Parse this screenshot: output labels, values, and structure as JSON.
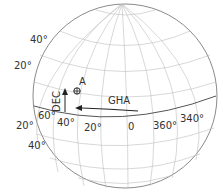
{
  "diagram": {
    "type": "celestial-sphere",
    "sphere": {
      "cx": 125,
      "cy": 96,
      "r": 92
    },
    "colors": {
      "outline": "#8a8a8a",
      "grid": "#bdbdbd",
      "equator": "#555555",
      "text": "#333333"
    },
    "left_dec_labels": [
      {
        "text": "40°",
        "x": 34,
        "y": 40
      },
      {
        "text": "20°",
        "x": 14,
        "y": 68
      },
      {
        "text": "20°",
        "x": 16,
        "y": 128
      },
      {
        "text": "40°",
        "x": 28,
        "y": 148
      }
    ],
    "equator_labels": [
      {
        "text": "60°",
        "x": 38,
        "y": 118
      },
      {
        "text": "40°",
        "x": 56,
        "y": 125
      },
      {
        "text": "20°",
        "x": 84,
        "y": 130
      },
      {
        "text": "0",
        "x": 127,
        "y": 130
      },
      {
        "text": "360°",
        "x": 154,
        "y": 128
      },
      {
        "text": "340°",
        "x": 180,
        "y": 120
      }
    ],
    "point": {
      "label": "A",
      "symbol": "⊕"
    },
    "arrows": {
      "dec_label": "DEC",
      "gha_label": "GHA"
    }
  }
}
